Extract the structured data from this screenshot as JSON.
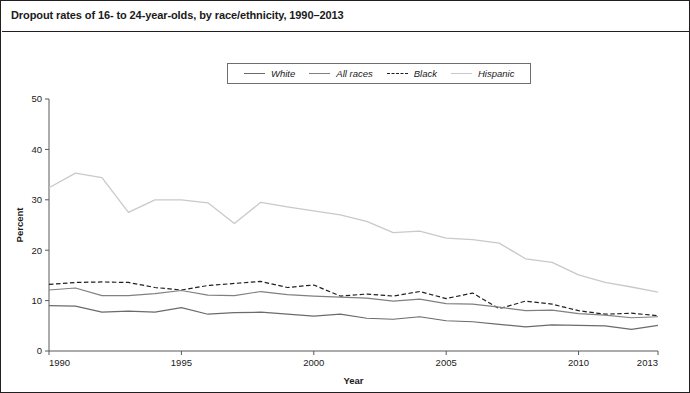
{
  "figure": {
    "title": "Dropout rates of 16- to 24-year-olds, by race/ethnicity, 1990–2013",
    "border_color": "#231f20",
    "background": "#ffffff"
  },
  "legend": {
    "position": "top-center",
    "entries": [
      {
        "label": "White",
        "color": "#6b6b6b",
        "style": "solid"
      },
      {
        "label": "All races",
        "color": "#808080",
        "style": "solid"
      },
      {
        "label": "Black",
        "color": "#231f20",
        "style": "dashed"
      },
      {
        "label": "Hispanic",
        "color": "#c9c9c9",
        "style": "solid"
      }
    ]
  },
  "chart_data": {
    "type": "line",
    "title": "Dropout rates of 16- to 24-year-olds, by race/ethnicity, 1990–2013",
    "xlabel": "Year",
    "ylabel": "Percent",
    "xlim": [
      1990,
      2013
    ],
    "ylim": [
      0,
      50
    ],
    "yticks": [
      0,
      10,
      20,
      30,
      40,
      50
    ],
    "xticks": [
      1990,
      1995,
      2000,
      2005,
      2010,
      2013
    ],
    "grid": false,
    "x": [
      1990,
      1991,
      1992,
      1993,
      1994,
      1995,
      1996,
      1997,
      1998,
      1999,
      2000,
      2001,
      2002,
      2003,
      2004,
      2005,
      2006,
      2007,
      2008,
      2009,
      2010,
      2011,
      2012,
      2013
    ],
    "series": [
      {
        "name": "Hispanic",
        "color": "#c9c9c9",
        "style": "solid",
        "width": 1.3,
        "values": [
          32.4,
          35.3,
          34.4,
          27.5,
          30.0,
          30.0,
          29.4,
          25.3,
          29.5,
          28.6,
          27.8,
          27.0,
          25.7,
          23.5,
          23.8,
          22.4,
          22.1,
          21.4,
          18.3,
          17.6,
          15.1,
          13.6,
          12.7,
          11.7
        ]
      },
      {
        "name": "Black",
        "color": "#231f20",
        "style": "dashed",
        "width": 1.2,
        "values": [
          13.2,
          13.6,
          13.7,
          13.6,
          12.6,
          12.1,
          13.0,
          13.4,
          13.8,
          12.6,
          13.1,
          10.9,
          11.3,
          10.9,
          11.8,
          10.4,
          11.5,
          8.4,
          9.9,
          9.3,
          8.0,
          7.3,
          7.5,
          7.0
        ]
      },
      {
        "name": "All races",
        "color": "#808080",
        "style": "solid",
        "width": 1.2,
        "values": [
          12.1,
          12.5,
          11.0,
          11.0,
          11.4,
          12.0,
          11.1,
          11.0,
          11.8,
          11.2,
          10.9,
          10.7,
          10.5,
          9.9,
          10.3,
          9.4,
          9.3,
          8.7,
          8.0,
          8.1,
          7.4,
          7.1,
          6.6,
          6.8
        ]
      },
      {
        "name": "White",
        "color": "#6b6b6b",
        "style": "solid",
        "width": 1.2,
        "values": [
          9.0,
          8.9,
          7.7,
          7.9,
          7.7,
          8.6,
          7.3,
          7.6,
          7.7,
          7.3,
          6.9,
          7.3,
          6.5,
          6.3,
          6.8,
          6.0,
          5.8,
          5.3,
          4.8,
          5.2,
          5.1,
          5.0,
          4.3,
          5.1
        ]
      }
    ]
  }
}
